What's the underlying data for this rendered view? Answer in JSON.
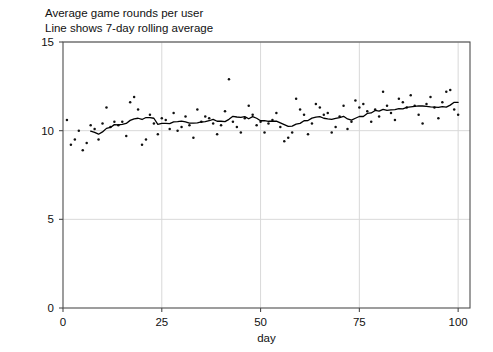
{
  "chart_data": {
    "type": "scatter",
    "title": "Average game rounds per user",
    "subtitle": "Line shows 7-day rolling average",
    "xlabel": "day",
    "ylabel": "",
    "xlim": [
      0,
      103
    ],
    "ylim": [
      0,
      15
    ],
    "xticks": [
      0,
      25,
      50,
      75,
      100
    ],
    "yticks": [
      0,
      5,
      10,
      15
    ],
    "grid": true,
    "legend": "none",
    "marker_color": "#111111",
    "line_color": "#000000",
    "grid_color": "#d9d9d9",
    "frame_color": "#4d4d4d",
    "background": "#ffffff",
    "series": [
      {
        "name": "Average game rounds per user",
        "type": "scatter",
        "x": [
          1,
          2,
          3,
          4,
          5,
          6,
          7,
          8,
          9,
          10,
          11,
          12,
          13,
          14,
          15,
          16,
          17,
          18,
          19,
          20,
          21,
          22,
          23,
          24,
          25,
          26,
          27,
          28,
          29,
          30,
          31,
          32,
          33,
          34,
          35,
          36,
          37,
          38,
          39,
          40,
          41,
          42,
          43,
          44,
          45,
          46,
          47,
          48,
          49,
          50,
          51,
          52,
          53,
          54,
          55,
          56,
          57,
          58,
          59,
          60,
          61,
          62,
          63,
          64,
          65,
          66,
          67,
          68,
          69,
          70,
          71,
          72,
          73,
          74,
          75,
          76,
          77,
          78,
          79,
          80,
          81,
          82,
          83,
          84,
          85,
          86,
          87,
          88,
          89,
          90,
          91,
          92,
          93,
          94,
          95,
          96,
          97,
          98,
          99,
          100
        ],
        "y": [
          10.6,
          9.2,
          9.5,
          10.0,
          8.9,
          9.3,
          10.3,
          10.1,
          9.5,
          10.4,
          11.3,
          10.2,
          10.5,
          10.3,
          10.5,
          9.7,
          11.6,
          11.9,
          11.2,
          9.2,
          9.5,
          10.9,
          10.4,
          9.8,
          10.7,
          10.6,
          10.1,
          11.0,
          10.0,
          10.2,
          10.8,
          10.3,
          9.6,
          11.2,
          10.5,
          10.8,
          10.7,
          10.4,
          9.8,
          10.3,
          11.1,
          12.9,
          10.5,
          10.2,
          9.9,
          10.7,
          11.4,
          10.9,
          10.3,
          10.5,
          9.9,
          10.4,
          10.6,
          11.0,
          10.2,
          9.4,
          9.6,
          9.9,
          11.8,
          11.2,
          10.9,
          9.8,
          10.4,
          11.5,
          11.3,
          10.9,
          11.0,
          9.9,
          10.2,
          10.8,
          11.4,
          10.1,
          10.5,
          11.7,
          11.3,
          11.5,
          11.1,
          10.5,
          11.2,
          10.8,
          12.2,
          11.4,
          11.0,
          10.6,
          11.8,
          11.6,
          11.3,
          12.0,
          11.4,
          10.9,
          10.4,
          11.5,
          11.9,
          11.3,
          10.7,
          11.6,
          12.2,
          12.3,
          11.2,
          10.9
        ]
      },
      {
        "name": "7-day rolling average",
        "type": "line",
        "x": [
          7,
          8,
          9,
          10,
          11,
          12,
          13,
          14,
          15,
          16,
          17,
          18,
          19,
          20,
          21,
          22,
          23,
          24,
          25,
          26,
          27,
          28,
          29,
          30,
          31,
          32,
          33,
          34,
          35,
          36,
          37,
          38,
          39,
          40,
          41,
          42,
          43,
          44,
          45,
          46,
          47,
          48,
          49,
          50,
          51,
          52,
          53,
          54,
          55,
          56,
          57,
          58,
          59,
          60,
          61,
          62,
          63,
          64,
          65,
          66,
          67,
          68,
          69,
          70,
          71,
          72,
          73,
          74,
          75,
          76,
          77,
          78,
          79,
          80,
          81,
          82,
          83,
          84,
          85,
          86,
          87,
          88,
          89,
          90,
          91,
          92,
          93,
          94,
          95,
          96,
          97,
          98,
          99,
          100
        ],
        "y": [
          9.97,
          9.9,
          9.8,
          9.93,
          10.13,
          10.18,
          10.34,
          10.33,
          10.36,
          10.41,
          10.58,
          10.67,
          10.7,
          10.63,
          10.74,
          10.74,
          10.7,
          10.36,
          10.41,
          10.41,
          10.4,
          10.5,
          10.51,
          10.54,
          10.49,
          10.43,
          10.43,
          10.44,
          10.49,
          10.51,
          10.56,
          10.64,
          10.53,
          10.53,
          10.51,
          10.64,
          10.81,
          10.77,
          10.75,
          10.79,
          10.67,
          10.79,
          10.7,
          10.56,
          10.57,
          10.53,
          10.53,
          10.54,
          10.44,
          10.34,
          10.24,
          10.26,
          10.37,
          10.41,
          10.56,
          10.57,
          10.71,
          10.76,
          10.79,
          10.7,
          10.66,
          10.64,
          10.69,
          10.74,
          10.81,
          10.66,
          10.59,
          10.7,
          10.8,
          10.8,
          10.97,
          11.0,
          11.14,
          11.1,
          11.2,
          11.14,
          11.17,
          11.19,
          11.24,
          11.23,
          11.31,
          11.34,
          11.37,
          11.4,
          11.39,
          11.37,
          11.34,
          11.33,
          11.31,
          11.36,
          11.33,
          11.44,
          11.6,
          11.6
        ]
      }
    ]
  }
}
